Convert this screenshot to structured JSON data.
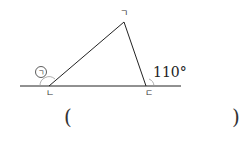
{
  "diagram": {
    "type": "triangle-exterior-angle",
    "vertices": [
      {
        "name": "top",
        "label": "ㄱ",
        "x": 124,
        "y": 22
      },
      {
        "name": "left",
        "label": "ㄴ",
        "x": 49,
        "y": 86
      },
      {
        "name": "right",
        "label": "ㄷ",
        "x": 146,
        "y": 86
      }
    ],
    "unknown_angle_label": "㉠",
    "given_angle": "110°",
    "colors": {
      "line": "#222222",
      "arc": "#999999"
    }
  },
  "answer": {
    "open_paren": "(",
    "close_paren": ")",
    "value": ""
  }
}
